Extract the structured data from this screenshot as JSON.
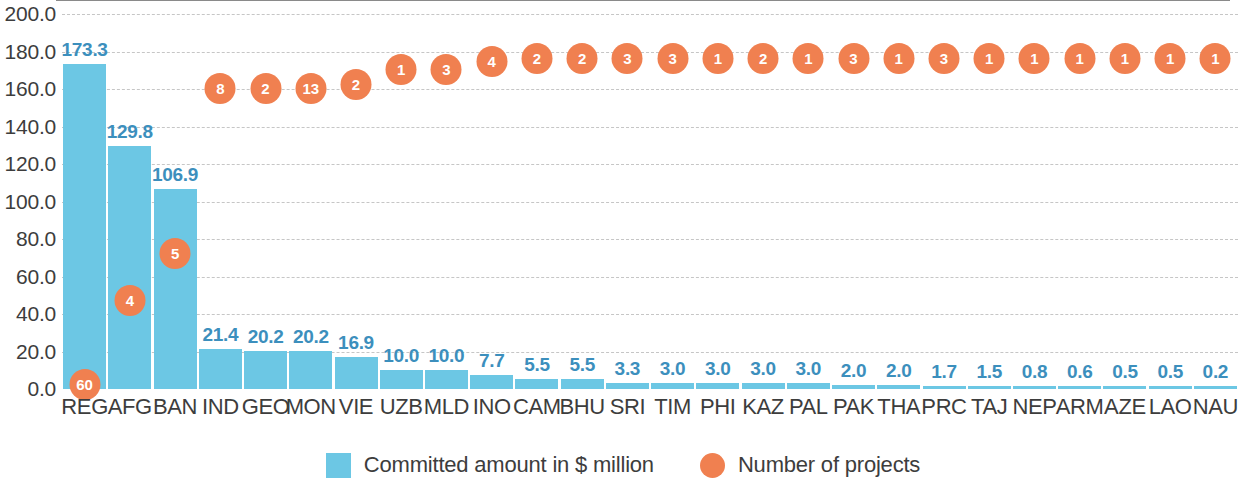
{
  "chart_data": {
    "type": "bar",
    "title": "",
    "subtitle": "",
    "xlabel": "",
    "ylabel": "",
    "ylim": [
      0,
      200
    ],
    "ytick_step": 20,
    "grid": true,
    "legend_position": "bottom-center",
    "categories": [
      "REG",
      "AFG",
      "BAN",
      "IND",
      "GEO",
      "MON",
      "VIE",
      "UZB",
      "MLD",
      "INO",
      "CAM",
      "BHU",
      "SRI",
      "TIM",
      "PHI",
      "KAZ",
      "PAL",
      "PAK",
      "THA",
      "PRC",
      "TAJ",
      "NEP",
      "ARM",
      "AZE",
      "LAO",
      "NAU"
    ],
    "ytick_labels": [
      "0.0",
      "20.0",
      "40.0",
      "60.0",
      "80.0",
      "100.0",
      "120.0",
      "140.0",
      "160.0",
      "180.0",
      "200.0"
    ],
    "ytick_values": [
      0,
      20,
      40,
      60,
      80,
      100,
      120,
      140,
      160,
      180,
      200
    ],
    "series": [
      {
        "name": "Committed amount in $ million",
        "type": "bar",
        "color": "#6cc7e4",
        "values": [
          173.3,
          129.8,
          106.9,
          21.4,
          20.2,
          20.2,
          16.9,
          10.0,
          10.0,
          7.7,
          5.5,
          5.5,
          3.3,
          3.0,
          3.0,
          3.0,
          3.0,
          2.0,
          2.0,
          1.7,
          1.5,
          0.8,
          0.6,
          0.5,
          0.5,
          0.2
        ],
        "labels": [
          "173.3",
          "129.8",
          "106.9",
          "21.4",
          "20.2",
          "20.2",
          "16.9",
          "10.0",
          "10.0",
          "7.7",
          "5.5",
          "5.5",
          "3.3",
          "3.0",
          "3.0",
          "3.0",
          "3.0",
          "2.0",
          "2.0",
          "1.7",
          "1.5",
          "0.8",
          "0.6",
          "0.5",
          "0.5",
          "0.2"
        ]
      },
      {
        "name": "Number of projects",
        "type": "scatter",
        "color": "#f08050",
        "values": [
          60,
          4,
          5,
          8,
          2,
          13,
          2,
          1,
          3,
          4,
          2,
          2,
          3,
          3,
          1,
          2,
          1,
          3,
          1,
          3,
          1,
          1,
          1,
          1,
          1,
          1
        ],
        "labels": [
          "60",
          "4",
          "5",
          "8",
          "2",
          "13",
          "2",
          "1",
          "3",
          "4",
          "2",
          "2",
          "3",
          "3",
          "1",
          "2",
          "1",
          "3",
          "1",
          "3",
          "1",
          "1",
          "1",
          "1",
          "1",
          "1"
        ],
        "marker_y_positions": [
          205,
          160,
          135,
          47,
          47,
          47,
          45,
          37,
          37,
          33,
          31,
          31,
          31,
          31,
          31,
          31,
          31,
          31,
          31,
          31,
          31,
          31,
          31,
          31,
          31,
          31
        ]
      }
    ]
  },
  "legend": {
    "items": [
      {
        "label": "Committed amount in $ million",
        "marker": "square-swatch",
        "color": "#6cc7e4"
      },
      {
        "label": "Number of projects",
        "marker": "circle-swatch",
        "color": "#f08050"
      }
    ]
  },
  "colors": {
    "bar": "#6cc7e4",
    "bubble": "#f08050",
    "value_label": "#3c8fbd",
    "axis_text": "#3d3d3d",
    "gridline": "#c6c6c6",
    "background": "#ffffff"
  }
}
